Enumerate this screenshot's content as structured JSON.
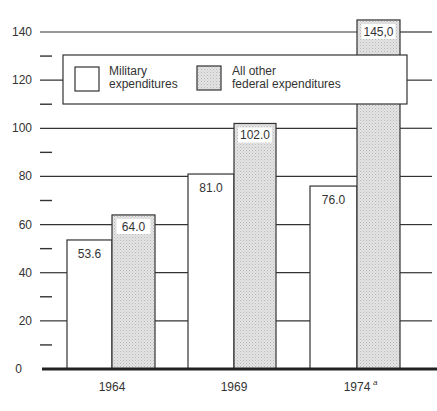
{
  "chart_data": {
    "type": "bar",
    "title": "",
    "xlabel": "",
    "ylabel": "",
    "categories": [
      "1964",
      "1969",
      "1974"
    ],
    "category_footnotes": [
      "",
      "",
      "a"
    ],
    "series": [
      {
        "name": "Military expenditures",
        "values": [
          53.6,
          81.0,
          76.0
        ],
        "labels": [
          "53.6",
          "81.0",
          "76.0"
        ],
        "fill": "#ffffff"
      },
      {
        "name": "All other federal expenditures",
        "values": [
          64.0,
          102.0,
          145.0
        ],
        "labels": [
          "64.0",
          "102.0",
          "145,0"
        ],
        "fill": "#d9d9d9"
      }
    ],
    "ylim": [
      0,
      140
    ],
    "yticks": [
      0,
      20,
      40,
      60,
      80,
      100,
      120,
      140
    ],
    "minor_ticks": [
      10,
      30,
      50,
      70,
      90,
      110,
      130
    ],
    "grid": true,
    "legend_position": "upper-left-inside",
    "legend": [
      {
        "line1": "Military",
        "line2": "expenditures"
      },
      {
        "line1": "All other",
        "line2": "federal expenditures"
      }
    ]
  },
  "colors": {
    "line": "#333333",
    "shaded": "#d9d9d9",
    "background": "#ffffff"
  }
}
